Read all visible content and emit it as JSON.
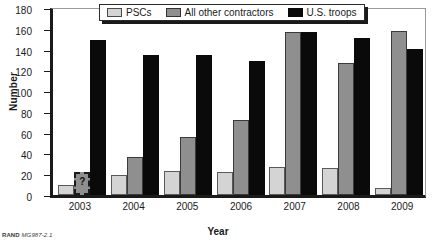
{
  "chart_data": {
    "type": "bar",
    "title": "",
    "xlabel": "Year",
    "ylabel": "Number",
    "categories": [
      "2003",
      "2004",
      "2005",
      "2006",
      "2007",
      "2008",
      "2009"
    ],
    "ylim": [
      0,
      180
    ],
    "yticks": [
      0,
      20,
      40,
      60,
      80,
      100,
      120,
      140,
      160,
      180
    ],
    "grid": false,
    "legend_position": "top-center",
    "series": [
      {
        "name": "PSCs",
        "color": "#d4d4d4",
        "values": [
          10,
          19,
          23,
          22,
          27,
          26,
          7
        ]
      },
      {
        "name": "All other contractors",
        "color": "#8f8f8f",
        "values": [
          22,
          37,
          56,
          72,
          157,
          127,
          158
        ],
        "uncertain": [
          true,
          false,
          false,
          false,
          false,
          false,
          false
        ]
      },
      {
        "name": "U.S. troops",
        "color": "#0a0a0a",
        "values": [
          149,
          135,
          135,
          129,
          157,
          151,
          141
        ]
      }
    ],
    "annotations": [
      {
        "category": "2003",
        "series": "All other contractors",
        "marker": "?",
        "note": "uncertain estimate shown with dashed outline"
      }
    ]
  },
  "axis": {
    "y_title": "Number",
    "x_title": "Year",
    "y_tick_labels": [
      "180",
      "160",
      "140",
      "120",
      "100",
      "80",
      "60",
      "40",
      "20",
      "0"
    ],
    "x_tick_labels": [
      "2003",
      "2004",
      "2005",
      "2006",
      "2007",
      "2008",
      "2009"
    ]
  },
  "legend": {
    "items": [
      {
        "label": "PSCs",
        "swatch": "psc"
      },
      {
        "label": "All other contractors",
        "swatch": "other"
      },
      {
        "label": "U.S. troops",
        "swatch": "troops"
      }
    ]
  },
  "footer": {
    "source_prefix": "RAND",
    "source_id": "MG987-2.1"
  }
}
